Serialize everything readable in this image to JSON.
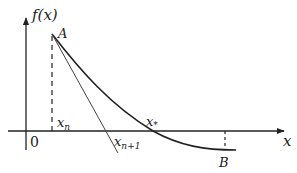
{
  "diagram": {
    "labels": {
      "y_axis": "f(x)",
      "x_axis": "x",
      "origin": "0",
      "point_a": "A",
      "point_b": "B",
      "x_n": "x",
      "x_n_sub": "n",
      "x_n1": "x",
      "x_n1_sub": "n+1",
      "x_star": "x",
      "x_star_sub": "*"
    },
    "colors": {
      "stroke": "#222222",
      "tangent": "#444444",
      "background": "#ffffff"
    }
  }
}
